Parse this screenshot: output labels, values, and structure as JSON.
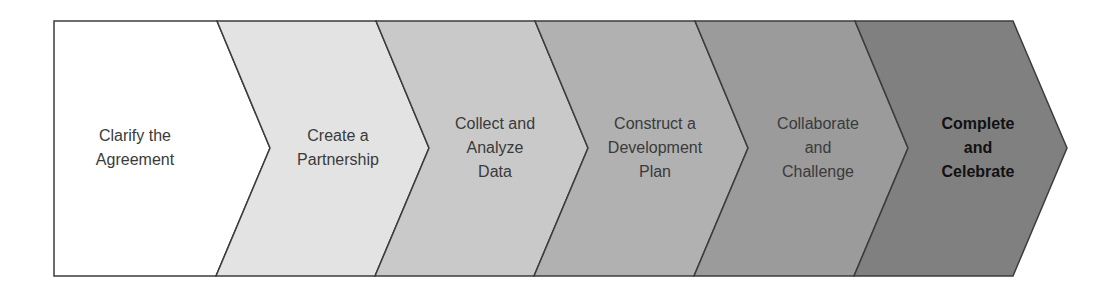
{
  "diagram": {
    "type": "process-chevron-flow",
    "frame": {
      "left": 54,
      "top": 21,
      "bottom": 276
    },
    "stroke_color": "#3c3c3c",
    "steps": [
      {
        "lines": [
          "Clarify the",
          "Agreement"
        ],
        "fill": "#ffffff",
        "emphasis": false
      },
      {
        "lines": [
          "Create a",
          "Partnership"
        ],
        "fill": "#e3e3e3",
        "emphasis": false
      },
      {
        "lines": [
          "Collect and",
          "Analyze",
          "Data"
        ],
        "fill": "#c9c9c9",
        "emphasis": false
      },
      {
        "lines": [
          "Construct a",
          "Development",
          "Plan"
        ],
        "fill": "#b1b1b1",
        "emphasis": false
      },
      {
        "lines": [
          "Collaborate",
          "and",
          "Challenge"
        ],
        "fill": "#9b9b9b",
        "emphasis": false
      },
      {
        "lines": [
          "Complete",
          "and",
          "Celebrate"
        ],
        "fill": "#808080",
        "emphasis": true
      }
    ]
  }
}
